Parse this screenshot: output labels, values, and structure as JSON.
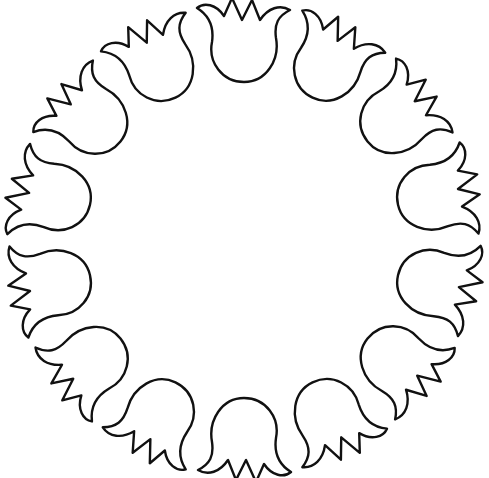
{
  "artwork": {
    "subject": "ring of tulip outlines",
    "tulip_count": 14,
    "center": [
      244,
      240
    ],
    "radius": 198,
    "stroke_color": "#111111",
    "fill_color": "#ffffff",
    "background": "#ffffff"
  }
}
